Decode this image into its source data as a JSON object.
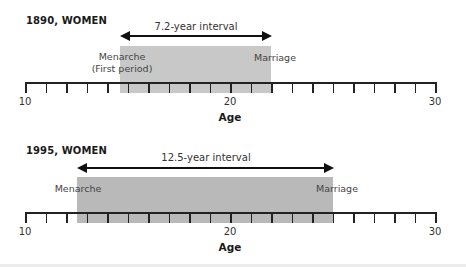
{
  "chart_data": [
    {
      "type": "timeline",
      "title": "1890, WOMEN",
      "xlabel": "Age",
      "xlim": [
        10,
        30
      ],
      "tick_step": 1,
      "tick_labels": [
        "10",
        "20",
        "30"
      ],
      "events": [
        {
          "name": "Menarche",
          "sublabel": "(First period)",
          "age": 14.8
        },
        {
          "name": "Marriage",
          "age": 22.0
        }
      ],
      "interval_years": 7.2,
      "interval_label": "7.2-year interval"
    },
    {
      "type": "timeline",
      "title": "1995, WOMEN",
      "xlabel": "Age",
      "xlim": [
        10,
        30
      ],
      "tick_step": 1,
      "tick_labels": [
        "10",
        "20",
        "30"
      ],
      "events": [
        {
          "name": "Menarche",
          "age": 12.5
        },
        {
          "name": "Marriage",
          "age": 25.0
        }
      ],
      "interval_years": 12.5,
      "interval_label": "12.5-year interval"
    }
  ],
  "panels": [
    {
      "title": "1890, WOMEN",
      "interval_label": "7.2-year interval",
      "menarche_label": "Menarche",
      "menarche_sublabel": "(First period)",
      "marriage_label": "Marriage",
      "tick_labels": {
        "t10": "10",
        "t20": "20",
        "t30": "30"
      },
      "axis_title": "Age"
    },
    {
      "title": "1995, WOMEN",
      "interval_label": "12.5-year interval",
      "menarche_label": "Menarche",
      "marriage_label": "Marriage",
      "tick_labels": {
        "t10": "10",
        "t20": "20",
        "t30": "30"
      },
      "axis_title": "Age"
    }
  ],
  "colors": {
    "shade_1890": "#c8c8c8",
    "shade_1995": "#b9b9b9",
    "axis": "#222222"
  }
}
